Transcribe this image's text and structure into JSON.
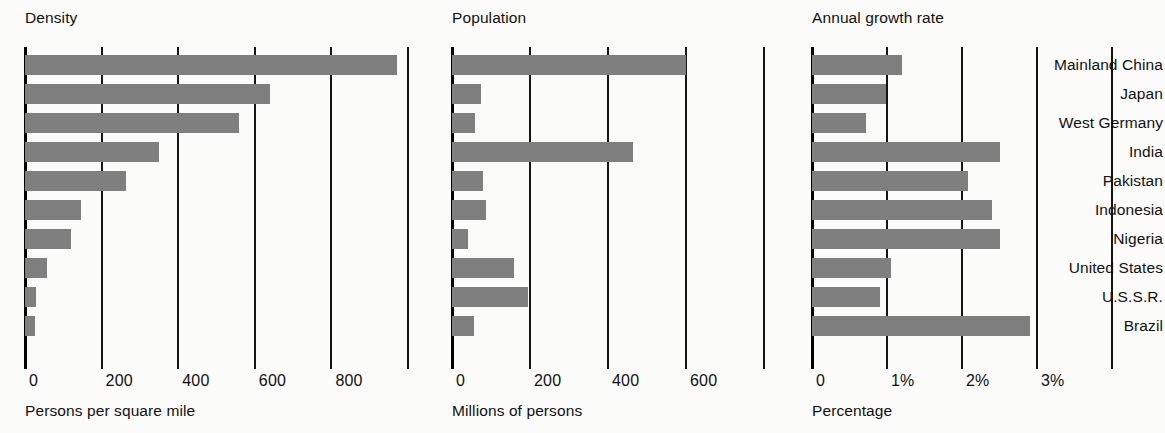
{
  "chart_data": {
    "type": "bar",
    "title": "",
    "orientation": "horizontal",
    "categories": [
      "Mainland China",
      "Japan",
      "West Germany",
      "India",
      "Pakistan",
      "Indonesia",
      "Nigeria",
      "United States",
      "U.S.S.R.",
      "Brazil"
    ],
    "panels": [
      {
        "title": "Density",
        "xlabel": "Persons per square mile",
        "unit": "persons per square mile",
        "ticks": [
          0,
          200,
          400,
          600,
          800
        ],
        "tick_labels": [
          "0",
          "200",
          "400",
          "600",
          "800"
        ],
        "xlim": [
          0,
          1000
        ],
        "values": [
          970,
          640,
          560,
          350,
          265,
          145,
          120,
          57,
          30,
          25
        ]
      },
      {
        "title": "Population",
        "xlabel": "Millions of persons",
        "unit": "millions of persons",
        "ticks": [
          0,
          200,
          400,
          600
        ],
        "tick_labels": [
          "0",
          "200",
          "400",
          "600"
        ],
        "xlim": [
          0,
          760
        ],
        "values": [
          600,
          75,
          60,
          465,
          80,
          88,
          42,
          160,
          195,
          57
        ]
      },
      {
        "title": "Annual growth rate",
        "xlabel": "Percentage",
        "unit": "percent",
        "ticks": [
          0,
          1,
          2,
          3
        ],
        "tick_labels": [
          "0",
          "1%",
          "2%",
          "3%"
        ],
        "xlim": [
          0,
          3.3
        ],
        "values": [
          1.2,
          0.98,
          0.72,
          2.5,
          2.08,
          2.4,
          2.5,
          1.05,
          0.9,
          2.9
        ]
      }
    ],
    "grid": true,
    "legend": null,
    "bar_color": "#807f7f",
    "axis_color": "#141414",
    "background": "#fbfbfa"
  }
}
